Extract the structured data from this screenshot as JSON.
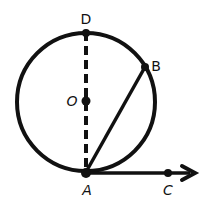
{
  "diagram": {
    "type": "geometry",
    "colors": {
      "stroke": "#111111",
      "background": "#ffffff"
    },
    "circle": {
      "center_label": "O",
      "cx": 86,
      "cy": 102,
      "r": 69
    },
    "points": [
      {
        "label": "D",
        "x": 86,
        "y": 32
      },
      {
        "label": "O",
        "x": 86,
        "y": 101
      },
      {
        "label": "B",
        "x": 145,
        "y": 67
      },
      {
        "label": "A",
        "x": 86,
        "y": 172
      },
      {
        "label": "C",
        "x": 168,
        "y": 173
      }
    ],
    "segments": [
      {
        "name": "diameter-DA",
        "from": "D",
        "to": "A",
        "style": "dashed"
      },
      {
        "name": "chord-AB",
        "from": "A",
        "to": "B",
        "style": "solid"
      },
      {
        "name": "tangent-ray-AC",
        "from": "A",
        "to": "C",
        "style": "solid",
        "arrow": true
      }
    ],
    "labels": {
      "D": "D",
      "O": "O",
      "B": "B",
      "A": "A",
      "C": "C"
    }
  }
}
